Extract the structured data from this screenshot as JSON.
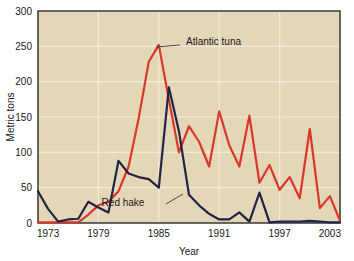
{
  "chart_data": {
    "type": "line",
    "title": "",
    "xlabel": "Year",
    "ylabel": "Metric tons",
    "xlim": [
      1973,
      2003
    ],
    "ylim": [
      0,
      300
    ],
    "grid": true,
    "legend_position": "inline-annotations",
    "xticks": [
      "1973",
      "1979",
      "1985",
      "1991",
      "1997",
      "2003"
    ],
    "xtick_values": [
      1973,
      1979,
      1985,
      1991,
      1997,
      2003
    ],
    "yticks": [
      "0",
      "50",
      "100",
      "150",
      "200",
      "250",
      "300"
    ],
    "ytick_values": [
      0,
      50,
      100,
      150,
      200,
      250,
      300
    ],
    "x": [
      1973,
      1974,
      1975,
      1976,
      1977,
      1978,
      1979,
      1980,
      1981,
      1982,
      1983,
      1984,
      1985,
      1986,
      1987,
      1988,
      1989,
      1990,
      1991,
      1992,
      1993,
      1994,
      1995,
      1996,
      1997,
      1998,
      1999,
      2000,
      2001,
      2002,
      2003
    ],
    "series": [
      {
        "name": "Atlantic tuna",
        "color": "#d8372a",
        "values": [
          1,
          1,
          1,
          1,
          1,
          12,
          25,
          30,
          45,
          80,
          148,
          228,
          252,
          175,
          100,
          137,
          115,
          80,
          158,
          110,
          80,
          152,
          57,
          82,
          47,
          65,
          35,
          133,
          21,
          38,
          3
        ],
        "label_text": "Atlantic tuna",
        "label_x_px": 186,
        "label_y_px": 45,
        "leader_from_px": [
          180,
          45
        ],
        "leader_to_px": [
          156,
          47
        ]
      },
      {
        "name": "Red hake",
        "color": "#232346",
        "values": [
          45,
          20,
          2,
          5,
          6,
          30,
          22,
          15,
          88,
          70,
          65,
          62,
          50,
          192,
          130,
          40,
          25,
          13,
          5,
          5,
          15,
          2,
          43,
          1,
          2,
          2,
          2,
          3,
          2,
          1,
          1
        ],
        "label_text": "Red hake",
        "label_x_px": 123,
        "label_y_px": 206,
        "leader_from_px": [
          166,
          204
        ],
        "leader_to_px": [
          183,
          194
        ]
      }
    ]
  },
  "style": {
    "plot_background": "#e4d7b8",
    "gridline_color": "#f2ead8",
    "axis_color": "#2b2b2b",
    "page_background": "#ffffff"
  }
}
